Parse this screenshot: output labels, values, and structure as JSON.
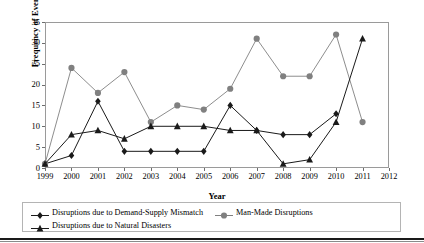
{
  "chart_data": {
    "type": "line",
    "title": "",
    "xlabel": "Year",
    "ylabel": "Frequency of Events",
    "xlim": [
      1999,
      2012
    ],
    "ylim": [
      0,
      35
    ],
    "ytick_step": 5,
    "grid": false,
    "legend_position": "bottom",
    "categories": [
      1999,
      2000,
      2001,
      2002,
      2003,
      2004,
      2005,
      2006,
      2007,
      2008,
      2009,
      2010,
      2011
    ],
    "xtick_labels": [
      "1999",
      "2000",
      "2001",
      "2002",
      "2003",
      "2004",
      "2005",
      "2006",
      "2007",
      "2008",
      "2009",
      "2010",
      "2011",
      "2012"
    ],
    "ytick_labels": [
      "0",
      "5",
      "10",
      "15",
      "20",
      "25",
      "30",
      "35"
    ],
    "series": [
      {
        "name": "Disruptions due to Demand-Supply Mismatch",
        "marker": "diamond",
        "color": "#1a1a1a",
        "values": [
          1,
          3,
          16,
          4,
          4,
          4,
          4,
          15,
          9,
          8,
          8,
          13,
          null
        ]
      },
      {
        "name": "Man-Made Disruptions",
        "marker": "circle",
        "color": "#808080",
        "values": [
          1,
          24,
          18,
          23,
          11,
          15,
          14,
          19,
          31,
          22,
          22,
          32,
          11
        ]
      },
      {
        "name": "Disruptions due to Natural Disasters",
        "marker": "triangle",
        "color": "#1a1a1a",
        "values": [
          1,
          8,
          9,
          7,
          10,
          10,
          10,
          9,
          9,
          1,
          2,
          11,
          31
        ]
      }
    ]
  },
  "axes": {
    "y_title": "Frequency of Events",
    "x_title": "Year"
  },
  "legend": {
    "items": [
      {
        "label": "Disruptions due to Demand-Supply Mismatch",
        "marker": "diamond",
        "color": "#1a1a1a"
      },
      {
        "label": "Man-Made Disruptions",
        "marker": "circle",
        "color": "#808080"
      },
      {
        "label": "Disruptions due to Natural Disasters",
        "marker": "triangle",
        "color": "#1a1a1a"
      }
    ]
  }
}
